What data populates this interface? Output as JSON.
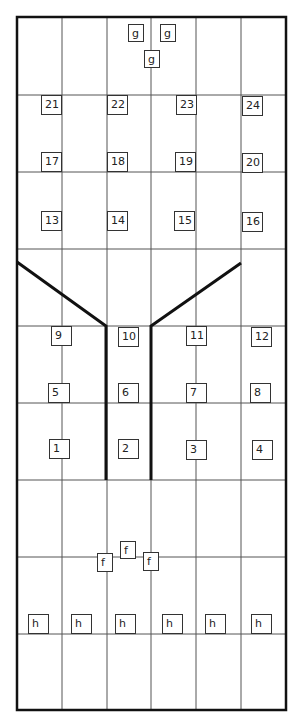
{
  "diagram": {
    "colors": {
      "line": "#555555",
      "thick": "#111111",
      "label_border": "#333333",
      "text": "#222222",
      "background": "#ffffff"
    },
    "frame": {
      "x": 17,
      "y": 17,
      "w": 269,
      "h": 693
    },
    "columns_x": [
      62,
      107,
      151,
      196,
      241
    ],
    "rows_y": [
      95,
      172,
      249,
      326,
      403,
      480,
      557,
      634
    ],
    "thick_paths": [
      [
        [
          17,
          262
        ],
        [
          106,
          326
        ],
        [
          106,
          480
        ]
      ],
      [
        [
          241,
          263
        ],
        [
          151,
          326
        ],
        [
          151,
          480
        ]
      ]
    ],
    "labels": [
      {
        "text": "g",
        "x": 128,
        "y": 24,
        "w": 16,
        "h": 18
      },
      {
        "text": "g",
        "x": 160,
        "y": 24,
        "w": 16,
        "h": 18
      },
      {
        "text": "g",
        "x": 144,
        "y": 50,
        "w": 16,
        "h": 18
      },
      {
        "text": "21",
        "x": 41,
        "y": 95,
        "w": 21,
        "h": 20
      },
      {
        "text": "22",
        "x": 107,
        "y": 95,
        "w": 21,
        "h": 20
      },
      {
        "text": "23",
        "x": 176,
        "y": 95,
        "w": 21,
        "h": 20
      },
      {
        "text": "24",
        "x": 242,
        "y": 96,
        "w": 21,
        "h": 20
      },
      {
        "text": "17",
        "x": 41,
        "y": 152,
        "w": 21,
        "h": 20
      },
      {
        "text": "18",
        "x": 107,
        "y": 152,
        "w": 21,
        "h": 20
      },
      {
        "text": "19",
        "x": 175,
        "y": 152,
        "w": 21,
        "h": 20
      },
      {
        "text": "20",
        "x": 242,
        "y": 153,
        "w": 21,
        "h": 20
      },
      {
        "text": "13",
        "x": 41,
        "y": 211,
        "w": 21,
        "h": 20
      },
      {
        "text": "14",
        "x": 107,
        "y": 211,
        "w": 21,
        "h": 20
      },
      {
        "text": "15",
        "x": 174,
        "y": 211,
        "w": 21,
        "h": 20
      },
      {
        "text": "16",
        "x": 242,
        "y": 212,
        "w": 21,
        "h": 20
      },
      {
        "text": "9",
        "x": 51,
        "y": 326,
        "w": 21,
        "h": 20
      },
      {
        "text": "10",
        "x": 118,
        "y": 327,
        "w": 21,
        "h": 20
      },
      {
        "text": "11",
        "x": 186,
        "y": 326,
        "w": 21,
        "h": 20
      },
      {
        "text": "12",
        "x": 251,
        "y": 327,
        "w": 21,
        "h": 20
      },
      {
        "text": "5",
        "x": 48,
        "y": 383,
        "w": 22,
        "h": 20
      },
      {
        "text": "6",
        "x": 118,
        "y": 383,
        "w": 21,
        "h": 20
      },
      {
        "text": "7",
        "x": 186,
        "y": 383,
        "w": 21,
        "h": 20
      },
      {
        "text": "8",
        "x": 250,
        "y": 383,
        "w": 21,
        "h": 20
      },
      {
        "text": "1",
        "x": 49,
        "y": 439,
        "w": 21,
        "h": 20
      },
      {
        "text": "2",
        "x": 118,
        "y": 439,
        "w": 21,
        "h": 20
      },
      {
        "text": "3",
        "x": 186,
        "y": 440,
        "w": 21,
        "h": 20
      },
      {
        "text": "4",
        "x": 252,
        "y": 440,
        "w": 21,
        "h": 20
      },
      {
        "text": "f",
        "x": 97,
        "y": 553,
        "w": 16,
        "h": 19
      },
      {
        "text": "f",
        "x": 120,
        "y": 541,
        "w": 16,
        "h": 18
      },
      {
        "text": "f",
        "x": 143,
        "y": 552,
        "w": 16,
        "h": 19
      },
      {
        "text": "h",
        "x": 28,
        "y": 614,
        "w": 21,
        "h": 20
      },
      {
        "text": "h",
        "x": 71,
        "y": 614,
        "w": 21,
        "h": 20
      },
      {
        "text": "h",
        "x": 115,
        "y": 614,
        "w": 21,
        "h": 20
      },
      {
        "text": "h",
        "x": 162,
        "y": 614,
        "w": 21,
        "h": 20
      },
      {
        "text": "h",
        "x": 205,
        "y": 614,
        "w": 21,
        "h": 20
      },
      {
        "text": "h",
        "x": 251,
        "y": 614,
        "w": 21,
        "h": 20
      }
    ]
  }
}
